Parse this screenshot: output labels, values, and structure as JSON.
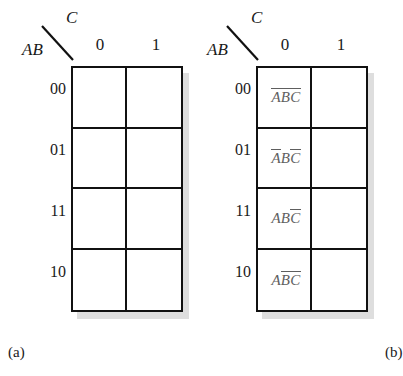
{
  "figure": {
    "type": "karnaugh-map-pair",
    "variables": [
      "A",
      "B",
      "C"
    ],
    "row_variable_label": "AB",
    "column_variable_label": "C",
    "column_headers": [
      "0",
      "1"
    ],
    "row_headers": [
      "00",
      "01",
      "11",
      "10"
    ]
  },
  "maps": [
    {
      "id": "a",
      "caption": "(a)",
      "corner": {
        "column_var": "C",
        "row_var": "AB"
      },
      "columns": [
        "0",
        "1"
      ],
      "rows": [
        "00",
        "01",
        "11",
        "10"
      ],
      "cells": [
        [
          {
            "text": "",
            "parts": []
          },
          {
            "text": "",
            "parts": []
          }
        ],
        [
          {
            "text": "",
            "parts": []
          },
          {
            "text": "",
            "parts": []
          }
        ],
        [
          {
            "text": "",
            "parts": []
          },
          {
            "text": "",
            "parts": []
          }
        ],
        [
          {
            "text": "",
            "parts": []
          },
          {
            "text": "",
            "parts": []
          }
        ]
      ]
    },
    {
      "id": "b",
      "caption": "(b)",
      "corner": {
        "column_var": "C",
        "row_var": "AB"
      },
      "columns": [
        "0",
        "1"
      ],
      "rows": [
        "00",
        "01",
        "11",
        "10"
      ],
      "cells": [
        [
          {
            "text": "A'B'C'",
            "parts": [
              {
                "v": "A",
                "bar": true
              },
              {
                "v": "B",
                "bar": true
              },
              {
                "v": "C",
                "bar": true
              }
            ]
          },
          {
            "text": "",
            "parts": []
          }
        ],
        [
          {
            "text": "A'BC'",
            "parts": [
              {
                "v": "A",
                "bar": true
              },
              {
                "v": "B",
                "bar": false
              },
              {
                "v": "C",
                "bar": true
              }
            ]
          },
          {
            "text": "",
            "parts": []
          }
        ],
        [
          {
            "text": "ABC'",
            "parts": [
              {
                "v": "A",
                "bar": false
              },
              {
                "v": "B",
                "bar": false
              },
              {
                "v": "C",
                "bar": true
              }
            ]
          },
          {
            "text": "",
            "parts": []
          }
        ],
        [
          {
            "text": "AB'C'",
            "parts": [
              {
                "v": "A",
                "bar": false
              },
              {
                "v": "B",
                "bar": true
              },
              {
                "v": "C",
                "bar": true
              }
            ]
          },
          {
            "text": "",
            "parts": []
          }
        ]
      ]
    }
  ],
  "colors": {
    "grid_line": "#111111",
    "shadow": "#c9c9c9",
    "text": "#1a1a1a",
    "minterm_text": "#5e5e5e",
    "background": "#ffffff"
  }
}
